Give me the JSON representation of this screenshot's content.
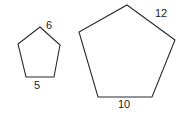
{
  "figure": {
    "background_color": "#ffffff",
    "stroke_color": "#2b2b2b",
    "label_color": "#1c1c1c",
    "shapes": [
      {
        "name": "small-pentagon",
        "sides": 5,
        "points": "40,27 60,45 54,77 26,77 18,44",
        "labels": [
          {
            "text": "6",
            "side": "upper-right"
          },
          {
            "text": "5",
            "side": "bottom"
          }
        ]
      },
      {
        "name": "large-pentagon",
        "sides": 5,
        "points": "127,5 175,40 152,97 98,97 79,32",
        "labels": [
          {
            "text": "12",
            "side": "upper-right"
          },
          {
            "text": "10",
            "side": "bottom"
          }
        ]
      }
    ]
  },
  "chart_data": {
    "type": "diagram",
    "xlabel": "",
    "ylabel": "",
    "categories": [
      "small pentagon",
      "large pentagon"
    ],
    "series": [
      {
        "name": "upper-right side length",
        "values": [
          6,
          12
        ]
      },
      {
        "name": "bottom side length",
        "values": [
          5,
          10
        ]
      }
    ],
    "annotations": [
      "6",
      "5",
      "12",
      "10"
    ]
  }
}
